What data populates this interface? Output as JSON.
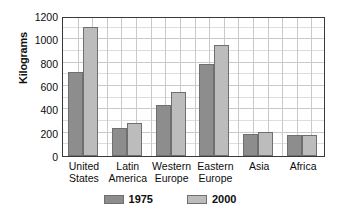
{
  "chart_data": {
    "type": "bar",
    "title": "",
    "subtitle": "",
    "xlabel": "",
    "ylabel": "Kilograms",
    "categories": [
      "United States",
      "Latin America",
      "Western Europe",
      "Eastern Europe",
      "Asia",
      "Africa"
    ],
    "category_lines": [
      [
        "United",
        "States"
      ],
      [
        "Latin",
        "America"
      ],
      [
        "Western",
        "Europe"
      ],
      [
        "Eastern",
        "Europe"
      ],
      [
        "Asia",
        ""
      ],
      [
        "Africa",
        ""
      ]
    ],
    "series": [
      {
        "name": "1975",
        "color": "#8d8d8d",
        "values": [
          720,
          240,
          440,
          785,
          190,
          180
        ]
      },
      {
        "name": "2000",
        "color": "#bcbcbc",
        "values": [
          1110,
          280,
          545,
          950,
          210,
          180
        ]
      }
    ],
    "ylim": [
      0,
      1200
    ],
    "yticks": [
      0,
      200,
      400,
      600,
      800,
      1000,
      1200
    ],
    "ytick_labels": [
      "0",
      "200",
      "400",
      "600",
      "800",
      "1000",
      "1200"
    ],
    "y_minor_step": 100,
    "grid": true,
    "grid_vertical_count": 18,
    "legend": {
      "position": "bottom",
      "entries": [
        {
          "label": "1975",
          "color": "#8d8d8d"
        },
        {
          "label": "2000",
          "color": "#bcbcbc"
        }
      ]
    },
    "colors": {
      "axis": "#3a3a3a",
      "grid_major": "#c9c9c9",
      "grid_minor": "#dedede",
      "bar_edge": "#6f6f6f",
      "text": "#0d0d0d",
      "background": "#ffffff"
    }
  }
}
